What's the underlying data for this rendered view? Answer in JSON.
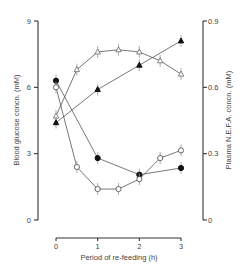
{
  "chart_data": {
    "type": "line",
    "title": "",
    "xlabel": "Period of re-feeding (h)",
    "ylabel": "Blood glucose concn. (mM)",
    "y2label": "Plasma N.E.F.A. concn. (mM)",
    "x_ticks": [
      "0",
      "1",
      "2",
      "3"
    ],
    "y_ticks": [
      "0",
      "3",
      "6",
      "9"
    ],
    "y2_ticks": [
      "0",
      "0.3",
      "0.6",
      "0.9"
    ],
    "xlim": [
      0,
      3
    ],
    "ylim": [
      0,
      9
    ],
    "y2lim": [
      0,
      0.9
    ],
    "grid": false,
    "legend": "none",
    "series": [
      {
        "name": "Blood glucose (filled circles)",
        "axis": "left",
        "marker": "filled-circle",
        "x": [
          0,
          1,
          2,
          3
        ],
        "values": [
          6.3,
          2.8,
          2.05,
          2.35
        ]
      },
      {
        "name": "Blood glucose (open circles)",
        "axis": "left",
        "marker": "open-circle",
        "x": [
          0,
          0.5,
          1,
          1.5,
          2,
          2.5,
          3
        ],
        "values": [
          6.0,
          2.4,
          1.4,
          1.4,
          1.85,
          2.8,
          3.15
        ]
      },
      {
        "name": "Plasma NEFA (open triangles)",
        "axis": "right",
        "marker": "open-triangle",
        "x": [
          0,
          0.5,
          1,
          1.5,
          2,
          2.5,
          3
        ],
        "values": [
          0.47,
          0.68,
          0.76,
          0.77,
          0.76,
          0.72,
          0.66
        ]
      },
      {
        "name": "Plasma NEFA (filled triangles)",
        "axis": "right",
        "marker": "filled-triangle",
        "x": [
          0,
          1,
          2,
          3
        ],
        "values": [
          0.44,
          0.59,
          0.7,
          0.81
        ]
      }
    ]
  }
}
